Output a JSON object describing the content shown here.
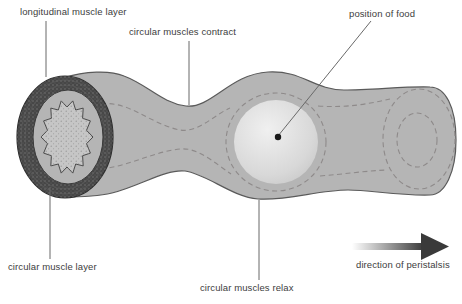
{
  "diagram": {
    "labels": {
      "longitudinal_muscle_layer": "longitudinal muscle layer",
      "circular_muscles_contract": "circular muscles contract",
      "position_of_food": "position of food",
      "circular_muscle_layer": "circular muscle layer",
      "circular_muscles_relax": "circular muscles relax",
      "direction_of_peristalsis": "direction of peristalsis"
    },
    "icons": {
      "direction_arrow": "right-arrow"
    },
    "colors": {
      "background": "#ffffff",
      "tube_fill": "#b5b5b5",
      "tube_outline": "#5a5a5a",
      "dashed_line": "#8e8a8a",
      "muscle_ring": "#474747",
      "ring_outline": "#2f2f2f",
      "lumen_fill": "#c6c6c6",
      "food_highlight": "#f0f0f0",
      "food_shade": "#c6c6c6",
      "arrow_dark": "#3a3a3a",
      "label_text": "#3d3d3d",
      "pointer_line": "#696969"
    }
  }
}
